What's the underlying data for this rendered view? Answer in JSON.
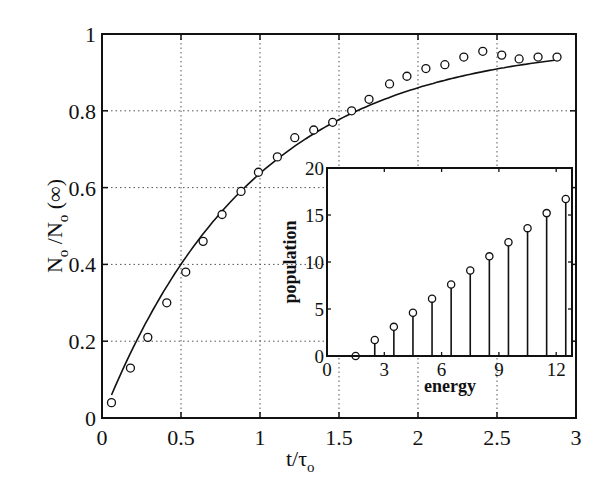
{
  "chart_data": [
    {
      "type": "scatter",
      "title": "",
      "xlabel": "t/τo",
      "ylabel": "No /No (∞)",
      "xlim": [
        0,
        3
      ],
      "ylim": [
        0,
        1
      ],
      "grid": true,
      "xticks": [
        "0",
        "0.5",
        "1",
        "1.5",
        "2",
        "2.5",
        "3"
      ],
      "yticks": [
        "0",
        "0.2",
        "0.4",
        "0.6",
        "0.8",
        "1"
      ],
      "series": [
        {
          "name": "data",
          "style": "open-circle",
          "x": [
            0.06,
            0.18,
            0.29,
            0.41,
            0.53,
            0.64,
            0.76,
            0.88,
            0.99,
            1.11,
            1.22,
            1.34,
            1.46,
            1.58,
            1.69,
            1.82,
            1.93,
            2.05,
            2.17,
            2.29,
            2.41,
            2.53,
            2.64,
            2.76,
            2.88
          ],
          "y": [
            0.04,
            0.13,
            0.21,
            0.3,
            0.38,
            0.46,
            0.53,
            0.59,
            0.64,
            0.68,
            0.73,
            0.75,
            0.77,
            0.8,
            0.83,
            0.87,
            0.89,
            0.91,
            0.92,
            0.94,
            0.955,
            0.945,
            0.935,
            0.94,
            0.94
          ]
        },
        {
          "name": "fit",
          "style": "solid-line",
          "formula": "0.98*(1-exp(-1.05*t))",
          "x_range": [
            0.06,
            2.9
          ]
        }
      ]
    },
    {
      "type": "stem",
      "title": "",
      "xlabel": "energy",
      "ylabel": "population",
      "xlim": [
        0,
        13
      ],
      "ylim": [
        0,
        20
      ],
      "grid": false,
      "xticks": [
        "0",
        "3",
        "6",
        "9",
        "12"
      ],
      "yticks": [
        "0",
        "5",
        "10",
        "15",
        "20"
      ],
      "series": [
        {
          "name": "population",
          "x": [
            1.5,
            2.5,
            3.5,
            4.5,
            5.5,
            6.5,
            7.5,
            8.5,
            9.5,
            10.5,
            11.5,
            12.5
          ],
          "y": [
            0,
            1.7,
            3.1,
            4.6,
            6.1,
            7.6,
            9.1,
            10.6,
            12.1,
            13.6,
            15.2,
            16.7
          ]
        }
      ]
    }
  ],
  "main": {
    "xlabel": "t/τ",
    "xlabel_sub": "o",
    "ylabel_parts": [
      "N",
      "o",
      " /N",
      "o",
      " (∞)"
    ]
  },
  "inset": {
    "xlabel": "energy",
    "ylabel": "population"
  }
}
